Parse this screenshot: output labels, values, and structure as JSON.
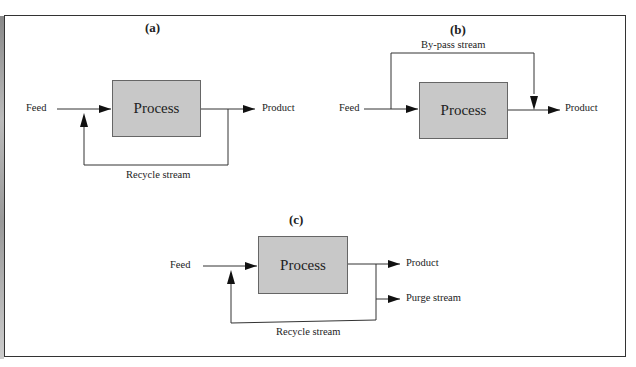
{
  "diagram": {
    "a": {
      "title": "(a)",
      "feed": "Feed",
      "process": "Process",
      "product": "Product",
      "recycle": "Recycle stream"
    },
    "b": {
      "title": "(b)",
      "feed": "Feed",
      "process": "Process",
      "product": "Product",
      "bypass": "By-pass stream"
    },
    "c": {
      "title": "(c)",
      "feed": "Feed",
      "process": "Process",
      "product": "Product",
      "purge": "Purge stream",
      "recycle": "Recycle stream"
    },
    "colors": {
      "process_fill": "#c8c8c8",
      "line": "#333333"
    }
  }
}
